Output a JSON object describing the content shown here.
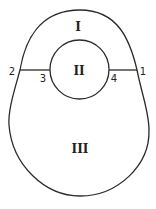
{
  "diagram": {
    "colors": {
      "stroke": "#2b2b2b",
      "background": "#ffffff",
      "text": "#222222"
    },
    "regions": [
      {
        "id": "I",
        "label": "I",
        "description": "outer region above the chord lines"
      },
      {
        "id": "II",
        "label": "II",
        "description": "inner circle"
      },
      {
        "id": "III",
        "label": "III",
        "description": "outer region below the chord lines"
      }
    ],
    "points": [
      {
        "id": "1",
        "label": "1",
        "position": "right outer boundary"
      },
      {
        "id": "2",
        "label": "2",
        "position": "left outer boundary"
      },
      {
        "id": "3",
        "label": "3",
        "position": "left of inner circle"
      },
      {
        "id": "4",
        "label": "4",
        "position": "right of inner circle"
      }
    ],
    "segments": [
      {
        "from": "2",
        "to": "3"
      },
      {
        "from": "4",
        "to": "1"
      }
    ]
  }
}
